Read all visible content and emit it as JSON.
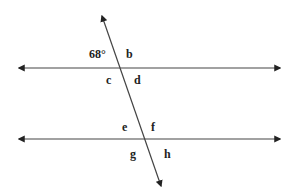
{
  "diagram": {
    "type": "parallel-lines-transversal",
    "colors": {
      "line": "#333333",
      "text": "#222222",
      "background": "#ffffff"
    },
    "lines": {
      "top_parallel": {
        "x1": 17,
        "y1": 68,
        "x2": 282,
        "y2": 68
      },
      "bottom_parallel": {
        "x1": 17,
        "y1": 139,
        "x2": 282,
        "y2": 139
      },
      "transversal": {
        "x1": 101,
        "y1": 14,
        "x2": 162,
        "y2": 188
      }
    },
    "labels": {
      "angle_given": "68°",
      "b": "b",
      "c": "c",
      "d": "d",
      "e": "e",
      "f": "f",
      "g": "g",
      "h": "h"
    }
  }
}
